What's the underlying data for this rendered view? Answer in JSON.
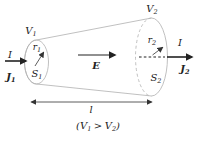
{
  "diagram": {
    "labels": {
      "v1": {
        "main": "V",
        "sub": "1"
      },
      "v2": {
        "main": "V",
        "sub": "2"
      },
      "current_in": "I",
      "current_out": "I",
      "j1": {
        "main": "J",
        "sub": "1"
      },
      "j2": {
        "main": "J",
        "sub": "2"
      },
      "r1": {
        "main": "r",
        "sub": "1"
      },
      "r2": {
        "main": "r",
        "sub": "2"
      },
      "s1": {
        "main": "S",
        "sub": "1"
      },
      "s2": {
        "main": "S",
        "sub": "2"
      },
      "e_field": "E",
      "length": "l",
      "condition": {
        "open": "(V",
        "sub1": "1",
        "gt": ">",
        "v2": "V",
        "sub2": "2",
        "close": ")"
      }
    },
    "colors": {
      "ink": "#222222",
      "outline": "#b0b0b0",
      "body_fill": "#f5f5f5",
      "background": "#ffffff"
    }
  }
}
